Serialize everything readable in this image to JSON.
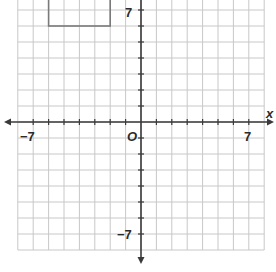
{
  "diagram": {
    "type": "coordinate-plane",
    "x_axis": {
      "label": "x",
      "min": -8,
      "max": 8,
      "tick_labels": [
        {
          "value": -7,
          "text": "−7"
        },
        {
          "value": 7,
          "text": "7"
        }
      ]
    },
    "y_axis": {
      "min": -8,
      "max": 8,
      "tick_labels": [
        {
          "value": 7,
          "text": "7"
        },
        {
          "value": -7,
          "text": "−7"
        }
      ]
    },
    "origin_label": "O",
    "grid_unit": 1,
    "shapes": [
      {
        "type": "rectangle",
        "x_min": -6,
        "x_max": -2,
        "y_min": 6,
        "y_max": 8,
        "note": "top edge cut off by image boundary"
      }
    ],
    "colors": {
      "grid": "#c8c8c8",
      "axis": "#3a3a3a",
      "shape": "#7a7a7a",
      "text": "#2b2b2b"
    }
  },
  "labels": {
    "x_axis_name": "x",
    "x_neg7": "−7",
    "x_pos7": "7",
    "y_pos7": "7",
    "y_neg7": "−7",
    "origin": "O"
  }
}
